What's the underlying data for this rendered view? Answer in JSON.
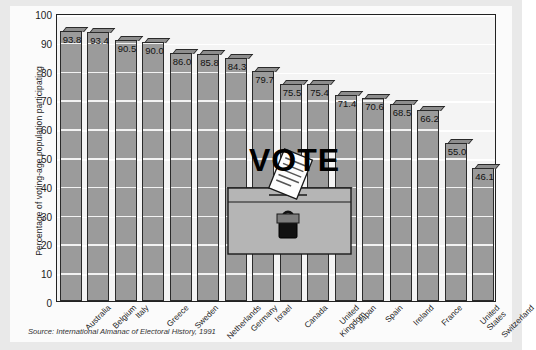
{
  "chart_data": {
    "type": "bar",
    "title": "",
    "xlabel": "",
    "ylabel": "Percentage of voting-age population participating",
    "ylim": [
      0,
      100
    ],
    "ytick_step": 10,
    "yticks": [
      100,
      90,
      80,
      70,
      60,
      50,
      40,
      30,
      20,
      10,
      0
    ],
    "grid": true,
    "legend": "none",
    "categories": [
      "Australia",
      "Belgium",
      "Italy",
      "Greece",
      "Sweden",
      "Netherlands",
      "Germany",
      "Israel",
      "Canada",
      "United Kingdom",
      "Japan",
      "Spain",
      "Ireland",
      "France",
      "United States",
      "Switzerland"
    ],
    "values": [
      93.8,
      93.4,
      90.5,
      90.0,
      86.0,
      85.8,
      84.3,
      79.7,
      75.5,
      75.4,
      71.4,
      70.6,
      68.5,
      66.2,
      55.0,
      46.1
    ],
    "value_labels": [
      "93.8",
      "93.4",
      "90.5",
      "90.0",
      "86.0",
      "85.8",
      "84.3",
      "79.7",
      "75.5",
      "75.4",
      "71.4",
      "70.6",
      "68.5",
      "66.2",
      "55.0",
      "46.1"
    ],
    "bar_color": "#9b9b9b",
    "bar_border_color": "#2a2a2a",
    "plot_background": "#f4f4f4",
    "gridline_color": "#f2f2f2"
  },
  "source": {
    "note": "Source: International Almanac of Electoral History, 1991"
  },
  "artwork": {
    "vote_word": "VOTE",
    "ballot_box_name": "ballot-box",
    "lock_name": "padlock",
    "slip_name": "ballot-slip"
  },
  "colors": {
    "page_background": "#e9e9e9",
    "card_background": "#fbfbfb",
    "text": "#1c1c1c",
    "accent_black": "#000000"
  }
}
